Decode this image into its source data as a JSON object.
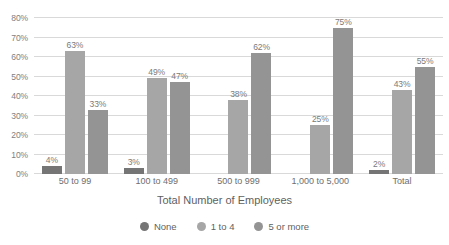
{
  "chart_data": {
    "type": "bar",
    "title": "",
    "xlabel": "Total Number of Employees",
    "ylabel": "",
    "categories": [
      "50 to 99",
      "100 to 499",
      "500 to 999",
      "1,000 to 5,000",
      "Total"
    ],
    "series": [
      {
        "name": "None",
        "color": "#757575",
        "values": [
          4,
          3,
          null,
          null,
          2
        ],
        "labels": [
          "4%",
          "3%",
          "",
          "",
          "2%"
        ]
      },
      {
        "name": "1 to 4",
        "color": "#a6a6a6",
        "values": [
          63,
          49,
          38,
          25,
          43
        ],
        "labels": [
          "63%",
          "49%",
          "38%",
          "25%",
          "43%"
        ]
      },
      {
        "name": "5 or more",
        "color": "#949494",
        "values": [
          33,
          47,
          62,
          75,
          55
        ],
        "labels": [
          "33%",
          "47%",
          "62%",
          "75%",
          "55%"
        ]
      }
    ],
    "ylim": [
      0,
      80
    ],
    "y_ticks": [
      "0%",
      "10%",
      "20%",
      "30%",
      "40%",
      "50%",
      "60%",
      "70%",
      "80%"
    ],
    "y_tick_values": [
      0,
      10,
      20,
      30,
      40,
      50,
      60,
      70,
      80
    ],
    "grid": true,
    "legend_position": "bottom",
    "gridline_color": "#d9d9d9",
    "label_color": "#7a7a7a"
  }
}
